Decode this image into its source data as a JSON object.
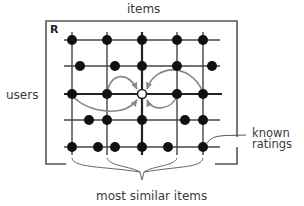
{
  "diagram": {
    "matrix_label": "R",
    "labels": {
      "columns": "items",
      "rows": "users",
      "known_ratings_line1": "known",
      "known_ratings_line2": "ratings",
      "most_similar_items": "most similar items"
    },
    "colors": {
      "frame": "#555555",
      "grid": "#444444",
      "dot": "#111111",
      "arrow": "#888888",
      "text": "#3a3a3a"
    },
    "grid": {
      "column_x": [
        72,
        107,
        142,
        177,
        203
      ],
      "row_y": [
        40,
        66,
        94,
        120,
        147
      ],
      "target_cell": {
        "row": 2,
        "col": 2,
        "x": 142,
        "y": 94,
        "style": "hollow"
      }
    },
    "known_ratings": [
      {
        "x": 72,
        "y": 40
      },
      {
        "x": 107,
        "y": 40
      },
      {
        "x": 142,
        "y": 40
      },
      {
        "x": 177,
        "y": 40
      },
      {
        "x": 203,
        "y": 40
      },
      {
        "x": 80,
        "y": 66
      },
      {
        "x": 115,
        "y": 66
      },
      {
        "x": 142,
        "y": 66
      },
      {
        "x": 177,
        "y": 66
      },
      {
        "x": 212,
        "y": 66
      },
      {
        "x": 72,
        "y": 94
      },
      {
        "x": 107,
        "y": 94
      },
      {
        "x": 177,
        "y": 94
      },
      {
        "x": 203,
        "y": 94
      },
      {
        "x": 89,
        "y": 120
      },
      {
        "x": 107,
        "y": 120
      },
      {
        "x": 142,
        "y": 120
      },
      {
        "x": 185,
        "y": 120
      },
      {
        "x": 203,
        "y": 120
      },
      {
        "x": 72,
        "y": 147
      },
      {
        "x": 98,
        "y": 147
      },
      {
        "x": 115,
        "y": 147
      },
      {
        "x": 142,
        "y": 147
      },
      {
        "x": 168,
        "y": 147
      },
      {
        "x": 203,
        "y": 147
      }
    ],
    "similarity_arrows": [
      {
        "from": "user-row item col1",
        "to": "target"
      },
      {
        "from": "user-row item col0",
        "to": "target"
      },
      {
        "from": "user-row item col3",
        "to": "target"
      },
      {
        "from": "user-row item col4",
        "to": "target"
      }
    ]
  }
}
